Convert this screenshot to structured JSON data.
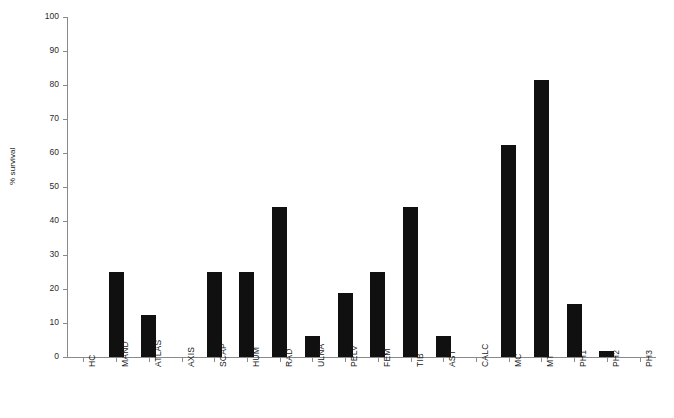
{
  "chart_data": {
    "type": "bar",
    "title": "",
    "subtitle": "",
    "xlabel": "",
    "ylabel": "% survival",
    "ylim": [
      0,
      100
    ],
    "ytick_step": 10,
    "yticks": [
      0,
      10,
      20,
      30,
      40,
      50,
      60,
      70,
      80,
      90,
      100
    ],
    "grid": false,
    "legend": null,
    "bar_color": "#101010",
    "axis_color": "#8a8a8a",
    "categories": [
      "HC",
      "MAND",
      "ATLAS",
      "AXIS",
      "SCAP",
      "HUM",
      "RAD",
      "ULNA",
      "PELV",
      "FEM",
      "TIB",
      "AST",
      "CALC",
      "MC",
      "MT",
      "PH1",
      "PH2",
      "PH3"
    ],
    "values": [
      0,
      25,
      12.5,
      0,
      25,
      25,
      44,
      6.25,
      18.75,
      25,
      44,
      6.25,
      0,
      62.5,
      81.5,
      15.6,
      1.9,
      0
    ],
    "series": [
      {
        "name": "% survival",
        "values": [
          0,
          25,
          12.5,
          0,
          25,
          25,
          44,
          6.25,
          18.75,
          25,
          44,
          6.25,
          0,
          62.5,
          81.5,
          15.6,
          1.9,
          0
        ]
      }
    ]
  }
}
